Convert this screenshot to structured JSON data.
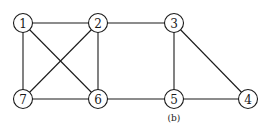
{
  "diagram": {
    "caption": "(b)",
    "caption_pos": {
      "x": 174,
      "y": 118
    },
    "node_radius": 9.5,
    "nodes": [
      {
        "id": "1",
        "label": "1",
        "x": 23,
        "y": 23
      },
      {
        "id": "2",
        "label": "2",
        "x": 98,
        "y": 23
      },
      {
        "id": "3",
        "label": "3",
        "x": 174,
        "y": 23
      },
      {
        "id": "4",
        "label": "4",
        "x": 248,
        "y": 99
      },
      {
        "id": "5",
        "label": "5",
        "x": 174,
        "y": 99
      },
      {
        "id": "6",
        "label": "6",
        "x": 98,
        "y": 99
      },
      {
        "id": "7",
        "label": "7",
        "x": 23,
        "y": 99
      }
    ],
    "edges": [
      {
        "from": "1",
        "to": "2"
      },
      {
        "from": "1",
        "to": "7"
      },
      {
        "from": "1",
        "to": "6"
      },
      {
        "from": "2",
        "to": "7"
      },
      {
        "from": "2",
        "to": "6"
      },
      {
        "from": "2",
        "to": "3"
      },
      {
        "from": "7",
        "to": "6"
      },
      {
        "from": "6",
        "to": "5"
      },
      {
        "from": "3",
        "to": "5"
      },
      {
        "from": "3",
        "to": "4"
      },
      {
        "from": "5",
        "to": "4"
      }
    ]
  }
}
